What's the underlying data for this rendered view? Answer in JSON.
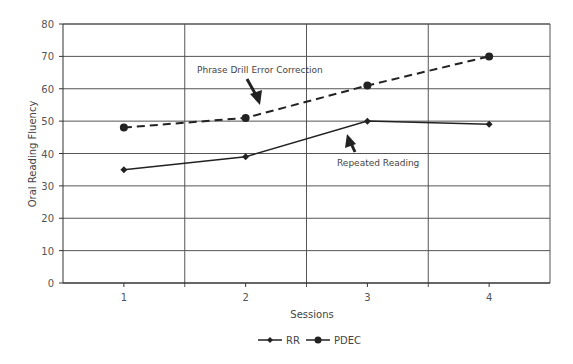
{
  "chart_data": {
    "type": "line",
    "title": "",
    "xlabel": "Sessions",
    "ylabel": "Oral Reading Fluency",
    "categories": [
      "1",
      "2",
      "3",
      "4"
    ],
    "ylim": [
      0,
      80
    ],
    "yticks": [
      0,
      10,
      20,
      30,
      40,
      50,
      60,
      70,
      80
    ],
    "grid": true,
    "legend_position": "bottom",
    "series": [
      {
        "name": "RR",
        "values": [
          35,
          39,
          50,
          49
        ],
        "line_style": "solid",
        "marker": "diamond",
        "color": "#222222"
      },
      {
        "name": "PDEC",
        "values": [
          48,
          51,
          61,
          70
        ],
        "line_style": "dashed",
        "marker": "circle",
        "color": "#222222"
      }
    ],
    "annotations": [
      {
        "text": "Phrase Drill Error Correction",
        "points_to": "PDEC session 2"
      },
      {
        "text": "Repeated Reading",
        "points_to": "RR between sessions 2 and 3"
      }
    ]
  },
  "colors": {
    "grid": "#555555",
    "axis": "#333333",
    "series": "#222222",
    "text": "#444444"
  }
}
